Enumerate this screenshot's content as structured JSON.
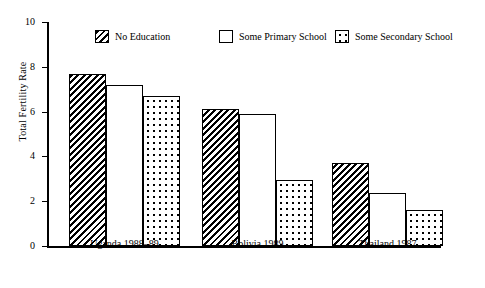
{
  "chart_data": {
    "type": "bar",
    "title": "",
    "xlabel": "",
    "ylabel": "Total Fertility Rate",
    "ylim": [
      0,
      10
    ],
    "yticks": [
      0,
      2,
      4,
      6,
      8,
      10
    ],
    "ytick_labels": [
      "0",
      "2",
      "4",
      "6",
      "8",
      "10"
    ],
    "grid": false,
    "legend_position": "top",
    "categories": [
      "Uganda 1988–89",
      "Bolivia 1989",
      "Thailand 1987"
    ],
    "series": [
      {
        "name": "No Education",
        "pattern": "diagonal-hatch",
        "values": [
          7.7,
          6.1,
          3.7
        ]
      },
      {
        "name": "Some Primary School",
        "pattern": "white-open",
        "values": [
          7.2,
          5.9,
          2.35
        ]
      },
      {
        "name": "Some Secondary School",
        "pattern": "dotted",
        "values": [
          6.7,
          2.95,
          1.6
        ]
      }
    ]
  },
  "axis": {
    "y_label": "Total Fertility Rate",
    "y_ticks": [
      "10",
      "8",
      "6",
      "4",
      "2",
      "0"
    ]
  },
  "legend": {
    "items": [
      {
        "label": "No Education"
      },
      {
        "label": "Some Primary School"
      },
      {
        "label": "Some Secondary School"
      }
    ]
  },
  "categories": [
    {
      "label": "Uganda 1988–89"
    },
    {
      "label": "Bolivia 1989"
    },
    {
      "label": "Thailand 1987"
    }
  ]
}
